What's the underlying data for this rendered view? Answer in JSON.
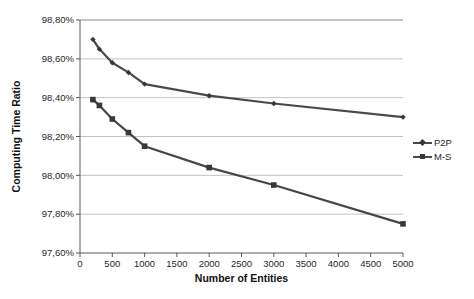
{
  "chart_data": {
    "type": "line",
    "title": "",
    "xlabel": "Number of Entities",
    "ylabel": "Computing Time Ratio",
    "xlim": [
      0,
      5000
    ],
    "ylim": [
      97.6,
      98.8
    ],
    "grid": "horizontal",
    "legend_position": "right",
    "x_ticks": {
      "values": [
        0,
        500,
        1000,
        1500,
        2000,
        2500,
        3000,
        3500,
        4000,
        4500,
        5000
      ],
      "labels": [
        "0",
        "500",
        "1000",
        "1500",
        "2000",
        "2500",
        "3000",
        "3500",
        "4000",
        "4500",
        "5000"
      ]
    },
    "y_ticks": {
      "values": [
        97.6,
        97.8,
        98.0,
        98.2,
        98.4,
        98.6,
        98.8
      ],
      "labels": [
        "97,60%",
        "97,80%",
        "98,00%",
        "98,20%",
        "98,40%",
        "98,60%",
        "98,80%"
      ]
    },
    "x": [
      200,
      300,
      500,
      750,
      1000,
      2000,
      3000,
      5000
    ],
    "series": [
      {
        "name": "P2P",
        "marker": "diamond",
        "color": "#4a4a4a",
        "marker_color": "#383838",
        "values": [
          98.7,
          98.65,
          98.58,
          98.53,
          98.47,
          98.41,
          98.37,
          98.3
        ]
      },
      {
        "name": "M-S",
        "marker": "square",
        "color": "#464646",
        "marker_color": "#383838",
        "values": [
          98.39,
          98.36,
          98.29,
          98.22,
          98.15,
          98.04,
          97.95,
          97.75
        ]
      }
    ]
  },
  "colors": {
    "background": "#ffffff",
    "gridline": "#c2c2c2",
    "top_gridline": "#8a8a8a",
    "axis": "#5a5a5a",
    "text": "#1f1f1f"
  }
}
